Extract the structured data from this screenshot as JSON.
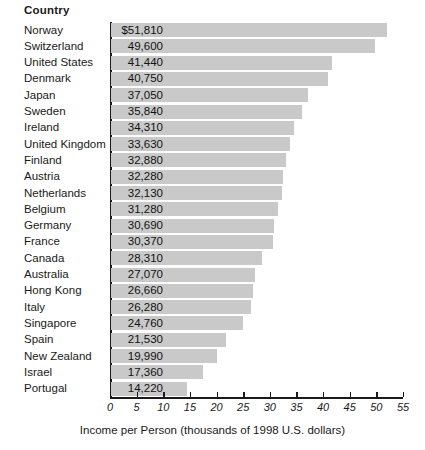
{
  "header": {
    "column_label": "Country"
  },
  "axis": {
    "caption": "Income per Person (thousands of 1998 U.S. dollars)",
    "ticks": [
      "0",
      "5",
      "10",
      "15",
      "20",
      "25",
      "30",
      "35",
      "40",
      "45",
      "50",
      "55"
    ]
  },
  "colors": {
    "bar": "#c9c9c9",
    "axis": "#1a1a1a",
    "text": "#1a1a1a",
    "background": "#ffffff"
  },
  "chart_data": {
    "type": "bar",
    "orientation": "horizontal",
    "title": "",
    "xlabel": "Income per Person (thousands of 1998 U.S. dollars)",
    "ylabel": "Country",
    "xlim": [
      0,
      55
    ],
    "xticks": [
      0,
      5,
      10,
      15,
      20,
      25,
      30,
      35,
      40,
      45,
      50,
      55
    ],
    "grid": false,
    "legend": "none",
    "units": "thousands of 1998 U.S. dollars",
    "categories": [
      "Norway",
      "Switzerland",
      "United States",
      "Denmark",
      "Japan",
      "Sweden",
      "Ireland",
      "United Kingdom",
      "Finland",
      "Austria",
      "Netherlands",
      "Belgium",
      "Germany",
      "France",
      "Canada",
      "Australia",
      "Hong Kong",
      "Italy",
      "Singapore",
      "Spain",
      "New Zealand",
      "Israel",
      "Portugal"
    ],
    "values": [
      51.81,
      49.6,
      41.44,
      40.75,
      37.05,
      35.84,
      34.31,
      33.63,
      32.88,
      32.28,
      32.13,
      31.28,
      30.69,
      30.37,
      28.31,
      27.07,
      26.66,
      26.28,
      24.76,
      21.53,
      19.99,
      17.36,
      14.22
    ],
    "data_labels": [
      "$51,810",
      "49,600",
      "41,440",
      "40,750",
      "37,050",
      "35,840",
      "34,310",
      "33,630",
      "32,880",
      "32,280",
      "32,130",
      "31,280",
      "30,690",
      "30,370",
      "28,310",
      "27,070",
      "26,660",
      "26,280",
      "24,760",
      "21,530",
      "19,990",
      "17,360",
      "14,220"
    ],
    "rows": [
      {
        "label": "Norway",
        "value": 51.81,
        "display": "$51,810"
      },
      {
        "label": "Switzerland",
        "value": 49.6,
        "display": "49,600"
      },
      {
        "label": "United States",
        "value": 41.44,
        "display": "41,440"
      },
      {
        "label": "Denmark",
        "value": 40.75,
        "display": "40,750"
      },
      {
        "label": "Japan",
        "value": 37.05,
        "display": "37,050"
      },
      {
        "label": "Sweden",
        "value": 35.84,
        "display": "35,840"
      },
      {
        "label": "Ireland",
        "value": 34.31,
        "display": "34,310"
      },
      {
        "label": "United Kingdom",
        "value": 33.63,
        "display": "33,630"
      },
      {
        "label": "Finland",
        "value": 32.88,
        "display": "32,880"
      },
      {
        "label": "Austria",
        "value": 32.28,
        "display": "32,280"
      },
      {
        "label": "Netherlands",
        "value": 32.13,
        "display": "32,130"
      },
      {
        "label": "Belgium",
        "value": 31.28,
        "display": "31,280"
      },
      {
        "label": "Germany",
        "value": 30.69,
        "display": "30,690"
      },
      {
        "label": "France",
        "value": 30.37,
        "display": "30,370"
      },
      {
        "label": "Canada",
        "value": 28.31,
        "display": "28,310"
      },
      {
        "label": "Australia",
        "value": 27.07,
        "display": "27,070"
      },
      {
        "label": "Hong Kong",
        "value": 26.66,
        "display": "26,660"
      },
      {
        "label": "Italy",
        "value": 26.28,
        "display": "26,280"
      },
      {
        "label": "Singapore",
        "value": 24.76,
        "display": "24,760"
      },
      {
        "label": "Spain",
        "value": 21.53,
        "display": "21,530"
      },
      {
        "label": "New Zealand",
        "value": 19.99,
        "display": "19,990"
      },
      {
        "label": "Israel",
        "value": 17.36,
        "display": "17,360"
      },
      {
        "label": "Portugal",
        "value": 14.22,
        "display": "14,220"
      }
    ]
  }
}
